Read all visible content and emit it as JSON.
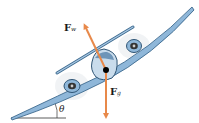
{
  "diagram": {
    "forces": [
      {
        "id": "Fw",
        "symbol": "F",
        "subscript": "w",
        "direction": "up-left, perpendicular to wings",
        "color": "#e8894a"
      },
      {
        "id": "Fg",
        "symbol": "F",
        "subscript": "g",
        "direction": "straight down",
        "color": "#e8894a"
      }
    ],
    "angle": {
      "symbol": "θ",
      "description": "bank angle between wing and horizontal"
    },
    "colors": {
      "airplane": "#8fb7d9",
      "airplane_dark": "#3d6a8f",
      "arrow": "#e8894a",
      "center_point": "#000000"
    }
  }
}
